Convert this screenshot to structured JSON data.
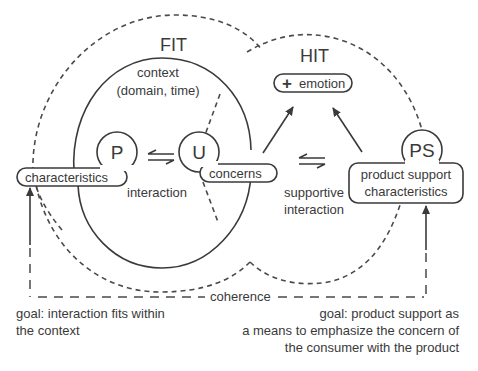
{
  "diagram": {
    "regions": {
      "fit": "FIT",
      "hit": "HIT"
    },
    "context": {
      "line1": "context",
      "line2": "(domain, time)"
    },
    "nodes": {
      "product": {
        "letter": "P",
        "label": "characteristics"
      },
      "user": {
        "letter": "U",
        "label": "concerns"
      },
      "product_support": {
        "letter": "PS",
        "label_line1": "product support",
        "label_line2": "characteristics"
      }
    },
    "emotion": {
      "symbol": "+",
      "label": "emotion"
    },
    "edges": {
      "interaction": "interaction",
      "supportive_line1": "supportive",
      "supportive_line2": "interaction",
      "coherence": "coherence"
    },
    "goals": {
      "left_line1": "goal: interaction fits within",
      "left_line2": "the context",
      "right_line1": "goal: product support as",
      "right_line2": "a means to emphasize the concern of",
      "right_line3": "the consumer with the product"
    },
    "colors": {
      "ink": "#3a3a3a",
      "background": "#ffffff"
    }
  }
}
